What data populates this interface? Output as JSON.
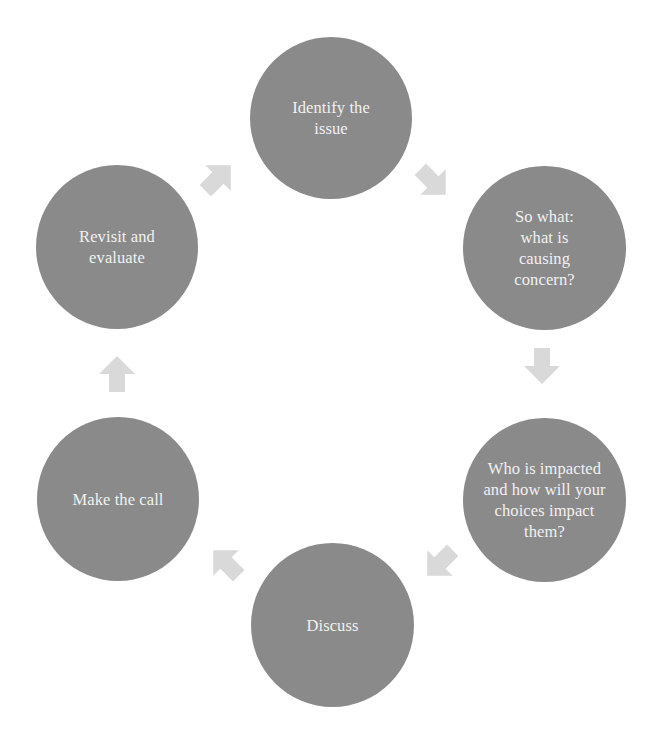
{
  "diagram": {
    "type": "cycle",
    "colors": {
      "node_fill": "#8a8a8a",
      "node_text": "#f1f1f1",
      "arrow_fill": "#d9d9d9",
      "background": "#ffffff"
    },
    "nodes": [
      {
        "id": "identify",
        "label": "Identify the issue"
      },
      {
        "id": "so-what",
        "label": "So what: what is causing concern?"
      },
      {
        "id": "who-impacted",
        "label": "Who is impacted and how will your choices impact them?"
      },
      {
        "id": "discuss",
        "label": "Discuss"
      },
      {
        "id": "make-call",
        "label": "Make the call"
      },
      {
        "id": "revisit",
        "label": "Revisit and evaluate"
      }
    ],
    "arrows": [
      {
        "from": "revisit",
        "to": "identify",
        "direction": "up-right",
        "icon": "arrow-up-right-icon"
      },
      {
        "from": "identify",
        "to": "so-what",
        "direction": "down-right",
        "icon": "arrow-down-right-icon"
      },
      {
        "from": "so-what",
        "to": "who-impacted",
        "direction": "down",
        "icon": "arrow-down-icon"
      },
      {
        "from": "who-impacted",
        "to": "discuss",
        "direction": "down-left",
        "icon": "arrow-down-left-icon"
      },
      {
        "from": "discuss",
        "to": "make-call",
        "direction": "up-left",
        "icon": "arrow-up-left-icon"
      },
      {
        "from": "make-call",
        "to": "revisit",
        "direction": "up",
        "icon": "arrow-up-icon"
      }
    ]
  }
}
